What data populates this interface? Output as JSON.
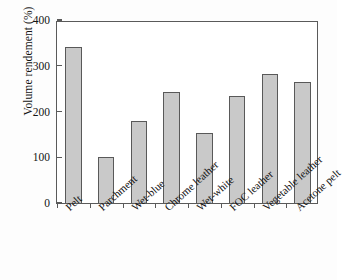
{
  "chart_data": {
    "type": "bar",
    "title": "",
    "subtitle": "",
    "xlabel": "",
    "ylabel": "Volume rendement (%)",
    "categories": [
      "Pelt",
      "Parchment",
      "Wet-blue",
      "Chrome leather",
      "Wet-white",
      "FOC leather",
      "Vegetable leather",
      "Acetone pelt"
    ],
    "values": [
      341,
      100,
      180,
      243,
      153,
      233,
      283,
      265
    ],
    "ylim": [
      0,
      400
    ],
    "yticks": [
      0,
      100,
      200,
      300,
      400
    ],
    "ytick_labels": [
      "0",
      "100",
      "200",
      "300",
      "400"
    ],
    "grid": false,
    "legend": null,
    "legend_position": "none",
    "series": [
      {
        "name": "Volume rendement (%)",
        "values": [
          341,
          100,
          180,
          243,
          153,
          233,
          283,
          265
        ]
      }
    ],
    "annotations": [],
    "colors": {
      "bar_fill": "#c9c9c9",
      "bar_edge": "#595959",
      "axis": "#5a5a5a",
      "text": "#141414",
      "background": "#ffffff"
    }
  }
}
